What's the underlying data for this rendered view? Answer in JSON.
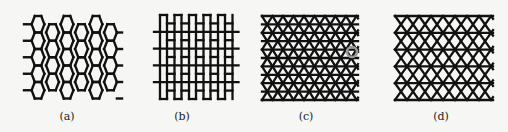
{
  "figure": {
    "panels": [
      {
        "id": "a",
        "label": "(a)",
        "lattice": "honeycomb (hexagonal)"
      },
      {
        "id": "b",
        "label": "(b)",
        "lattice": "brick-wall"
      },
      {
        "id": "c",
        "label": "(c)",
        "lattice": "triangular",
        "highlight": "circled vertex"
      },
      {
        "id": "d",
        "label": "(d)",
        "lattice": "kagome"
      }
    ],
    "colors": {
      "line": "#111111",
      "background": "#f6f6f4",
      "highlight": "#9a9a9a"
    }
  }
}
